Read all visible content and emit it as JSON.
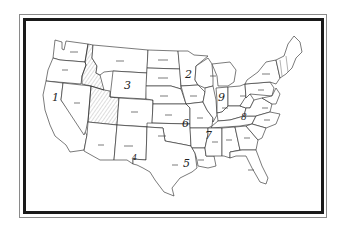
{
  "map": {
    "title": "",
    "subject": "United States map outline with numbered regions",
    "frame": {
      "outer_color": "#8a8a8a",
      "inner_color": "#1a1a1a"
    },
    "hatched_states": [
      "Idaho",
      "Utah",
      "Nevada (partial)"
    ],
    "region_numbers": [
      {
        "number": "1",
        "location": "California / Oregon west coast",
        "x": 55,
        "y": 100
      },
      {
        "number": "2",
        "location": "Minnesota",
        "x": 189,
        "y": 77
      },
      {
        "number": "3",
        "location": "Wyoming",
        "x": 128,
        "y": 88
      },
      {
        "number": "4",
        "location": "New Mexico (south edge)",
        "x": 136,
        "y": 159
      },
      {
        "number": "5",
        "location": "Texas",
        "x": 185,
        "y": 165
      },
      {
        "number": "6",
        "location": "Kansas",
        "x": 185,
        "y": 126
      },
      {
        "number": "7",
        "location": "Arkansas",
        "x": 209,
        "y": 138
      },
      {
        "number": "8",
        "location": "Kentucky / Tennessee",
        "x": 245,
        "y": 118
      },
      {
        "number": "9",
        "location": "Illinois / Indiana",
        "x": 221,
        "y": 100
      }
    ]
  }
}
